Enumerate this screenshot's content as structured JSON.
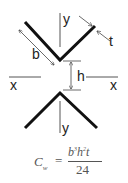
{
  "diagram": {
    "labels": {
      "y_top": "y",
      "y_bottom": "y",
      "x_left": "x",
      "x_right": "x",
      "b": "b",
      "t": "t",
      "h": "h"
    },
    "colors": {
      "section": "#111111",
      "dimension": "#444444",
      "axis": "#555555",
      "text": "#222222"
    }
  },
  "formula": {
    "lhs": "C",
    "lhs_sub": "w",
    "equals": "=",
    "numerator_b": "b",
    "numerator_b_exp": "3",
    "numerator_h": "h",
    "numerator_h_exp": "2",
    "numerator_t": "t",
    "denominator": "24"
  }
}
